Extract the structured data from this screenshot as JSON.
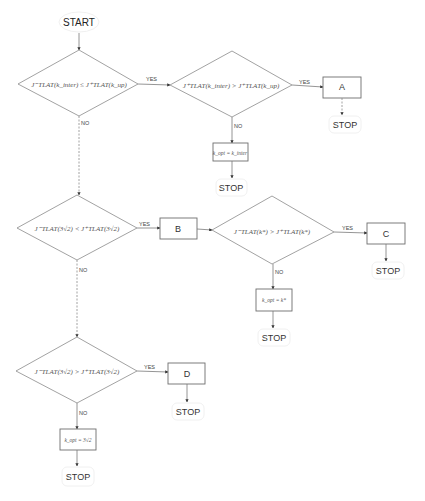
{
  "start": {
    "label": "START"
  },
  "labels": {
    "yes": "YES",
    "no": "NO",
    "stop": "STOP"
  },
  "decisions": [
    {
      "id": "d1",
      "condition": "J⁻TLAT(k_inter) ≤ J⁺TLAT(k_up)"
    },
    {
      "id": "d2",
      "condition": "J⁺TLAT(k_inter) > J⁺TLAT(k_up)"
    },
    {
      "id": "d3",
      "condition": "J⁻TLAT(3√2) < J⁺TLAT(3√2)"
    },
    {
      "id": "d4",
      "condition": "J⁻TLAT(k*) > J⁺TLAT(k*)"
    },
    {
      "id": "d5",
      "condition": "J⁻TLAT(3√2) > J⁺TLAT(3√2)"
    }
  ],
  "processes": [
    {
      "id": "A",
      "label": "A"
    },
    {
      "id": "B",
      "label": "B"
    },
    {
      "id": "C",
      "label": "C"
    },
    {
      "id": "D",
      "label": "D"
    },
    {
      "id": "p1",
      "label": "k_opt = k_inter"
    },
    {
      "id": "p2",
      "label": "k_opt = k*"
    },
    {
      "id": "p3",
      "label": "k_opt = 3√2"
    }
  ]
}
